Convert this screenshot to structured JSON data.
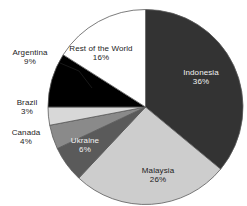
{
  "chart_data": {
    "type": "pie",
    "title": "",
    "subtitle": "",
    "xlabel": "",
    "ylabel": "",
    "legend_position": "none",
    "grid": false,
    "value_unit": "%",
    "start_angle_deg": 0,
    "direction": "clockwise",
    "categories": [
      "Indonesia",
      "Malaysia",
      "Ukraine",
      "Canada",
      "Brazil",
      "Argentina",
      "Rest of the World"
    ],
    "values": [
      36,
      26,
      6,
      4,
      3,
      9,
      16
    ],
    "slices": [
      {
        "label": "Indonesia",
        "value": 36,
        "value_text": "36%",
        "color": "#333333",
        "text_color": "#f2f2f2",
        "label_placement": "inside"
      },
      {
        "label": "Malaysia",
        "value": 26,
        "value_text": "26%",
        "color": "#cdcdcd",
        "text_color": "#1c1c1c",
        "label_placement": "inside"
      },
      {
        "label": "Ukraine",
        "value": 6,
        "value_text": "6%",
        "color": "#5a5a5a",
        "text_color": "#f2f2f2",
        "label_placement": "inside"
      },
      {
        "label": "Canada",
        "value": 4,
        "value_text": "4%",
        "color": "#8a8a8a",
        "text_color": "#1c1c1c",
        "label_placement": "outside"
      },
      {
        "label": "Brazil",
        "value": 3,
        "value_text": "3%",
        "color": "#d8d8d8",
        "text_color": "#1c1c1c",
        "label_placement": "outside"
      },
      {
        "label": "Argentina",
        "value": 9,
        "value_text": "9%",
        "color": "#000000",
        "text_color": "#1c1c1c",
        "label_placement": "outside-leader"
      },
      {
        "label": "Rest of the World",
        "value": 16,
        "value_text": "16%",
        "color": "#ffffff",
        "text_color": "#1c1c1c",
        "label_placement": "inside"
      }
    ],
    "outline_color": "#5a5a5a",
    "background_color": "#ffffff"
  }
}
